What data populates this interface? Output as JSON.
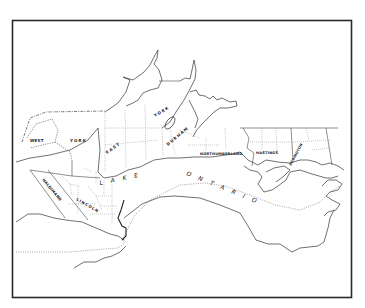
{
  "map": {
    "title": "",
    "region": "Lake Ontario north shore counties",
    "frame": {
      "x": 12,
      "y": 20,
      "width": 340,
      "height": 278,
      "stroke": "#2a2a2a"
    },
    "water_label": {
      "word1": "LAKE",
      "word2": "ONTARIO"
    },
    "counties": [
      {
        "id": "west-york",
        "label": "WEST"
      },
      {
        "id": "west-york-2",
        "label": "YORK"
      },
      {
        "id": "east-york",
        "label": "EAST"
      },
      {
        "id": "east-york-2",
        "label": "YORK"
      },
      {
        "id": "durham",
        "label": "DURHAM"
      },
      {
        "id": "northumberland",
        "label": "NORTHUMBERLAND"
      },
      {
        "id": "hastings",
        "label": "HASTINGS"
      },
      {
        "id": "lennox-addington",
        "label": "ADDINGTON"
      },
      {
        "id": "haldimand",
        "label": "HALDIMAND"
      },
      {
        "id": "lincoln",
        "label": "LINCOLN"
      }
    ],
    "colors": {
      "background": "#ffffff",
      "ink": "#222222"
    }
  }
}
